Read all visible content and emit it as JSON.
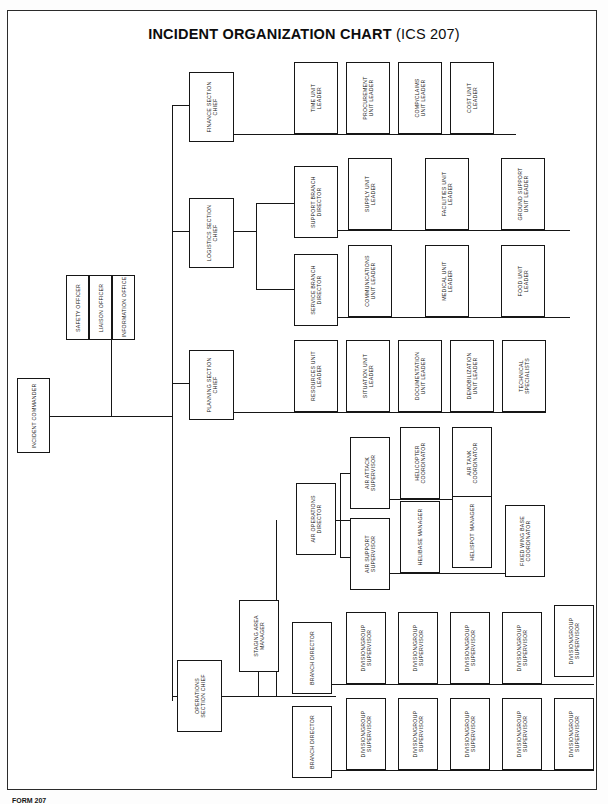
{
  "page": {
    "title_main": "INCIDENT ORGANIZATION CHART",
    "title_sub": "(ICS 207)",
    "footer": "FORM 207"
  },
  "chart_data": {
    "type": "diagram",
    "title": "INCIDENT ORGANIZATION CHART (ICS 207)",
    "orientation": "left-to-right hierarchy with rotated (vertical) box labels",
    "nodes": [
      {
        "id": "incident-commander",
        "label": "INCIDENT COMMANDER",
        "level": 0,
        "x": 17,
        "y": 378,
        "w": 33,
        "h": 75
      },
      {
        "id": "safety-officer",
        "label": "SAFETY OFFICER",
        "level": 1,
        "x": 66,
        "y": 275,
        "w": 23,
        "h": 65
      },
      {
        "id": "liaison-officer",
        "label": "LIAISON OFFICER",
        "level": 1,
        "x": 89,
        "y": 275,
        "w": 23,
        "h": 65
      },
      {
        "id": "information-officer",
        "label": "INFORMATION OFFICER",
        "level": 1,
        "x": 112,
        "y": 275,
        "w": 23,
        "h": 65
      },
      {
        "id": "finance-section-chief",
        "label": "FINANCE SECTION\nCHIEF",
        "level": 1,
        "x": 189,
        "y": 72,
        "w": 45,
        "h": 70
      },
      {
        "id": "time-unit-leader",
        "label": "TIME UNIT\nLEADER",
        "level": 2,
        "x": 294,
        "y": 62,
        "w": 44,
        "h": 72
      },
      {
        "id": "procurement-unit-leader",
        "label": "PROCUREMENT\nUNIT LEADER",
        "level": 2,
        "x": 346,
        "y": 62,
        "w": 44,
        "h": 72
      },
      {
        "id": "comp-claims-unit-leader",
        "label": "COMP/CLAIMS\nUNIT LEADER",
        "level": 2,
        "x": 398,
        "y": 62,
        "w": 44,
        "h": 72
      },
      {
        "id": "cost-unit-leader",
        "label": "COST UNIT\nLEADER",
        "level": 2,
        "x": 450,
        "y": 62,
        "w": 44,
        "h": 72
      },
      {
        "id": "logistics-section-chief",
        "label": "LOGISTICS SECTION\nCHIEF",
        "level": 1,
        "x": 189,
        "y": 198,
        "w": 45,
        "h": 70
      },
      {
        "id": "support-branch-director",
        "label": "SUPPORT BRANCH\nDIRECTOR",
        "level": 2,
        "x": 294,
        "y": 166,
        "w": 44,
        "h": 72
      },
      {
        "id": "supply-unit-leader",
        "label": "SUPPLY UNIT\nLEADER",
        "level": 3,
        "x": 348,
        "y": 158,
        "w": 44,
        "h": 72
      },
      {
        "id": "facilities-unit-leader",
        "label": "FACILITIES UNIT\nLEADER",
        "level": 3,
        "x": 425,
        "y": 158,
        "w": 44,
        "h": 72
      },
      {
        "id": "ground-support-unit-leader",
        "label": "GROUND SUPPORT\nUNIT LEADER",
        "level": 3,
        "x": 501,
        "y": 158,
        "w": 44,
        "h": 72
      },
      {
        "id": "service-branch-director",
        "label": "SERVICE BRANCH\nDIRECTOR",
        "level": 2,
        "x": 294,
        "y": 254,
        "w": 44,
        "h": 72
      },
      {
        "id": "communications-unit-leader",
        "label": "COMMUNICATIONS\nUNIT LEADER",
        "level": 3,
        "x": 348,
        "y": 245,
        "w": 44,
        "h": 72
      },
      {
        "id": "medical-unit-leader",
        "label": "MEDICAL UNIT\nLEADER",
        "level": 3,
        "x": 425,
        "y": 245,
        "w": 44,
        "h": 72
      },
      {
        "id": "food-unit-leader",
        "label": "FOOD UNIT\nLEADER",
        "level": 3,
        "x": 501,
        "y": 245,
        "w": 44,
        "h": 72
      },
      {
        "id": "planning-section-chief",
        "label": "PLANNING SECTION\nCHIEF",
        "level": 1,
        "x": 189,
        "y": 350,
        "w": 45,
        "h": 70
      },
      {
        "id": "resources-unit-leader",
        "label": "RESOURCES UNIT\nLEADER",
        "level": 2,
        "x": 294,
        "y": 340,
        "w": 44,
        "h": 72
      },
      {
        "id": "situation-unit-leader",
        "label": "SITUATION UNIT\nLEADER",
        "level": 2,
        "x": 346,
        "y": 340,
        "w": 44,
        "h": 72
      },
      {
        "id": "documentation-unit-leader",
        "label": "DOCUMENTATION\nUNIT LEADER",
        "level": 2,
        "x": 398,
        "y": 340,
        "w": 44,
        "h": 72
      },
      {
        "id": "demobilization-unit-leader",
        "label": "DEMOBILIZATION\nUNIT LEADER",
        "level": 2,
        "x": 450,
        "y": 340,
        "w": 44,
        "h": 72
      },
      {
        "id": "technical-specialists",
        "label": "TECHNICAL\nSPECIALISTS",
        "level": 2,
        "x": 502,
        "y": 340,
        "w": 44,
        "h": 72
      },
      {
        "id": "operations-section-chief",
        "label": "OPERATIONS\nSECTION CHIEF",
        "level": 1,
        "x": 177,
        "y": 660,
        "w": 45,
        "h": 72
      },
      {
        "id": "staging-area-manager",
        "label": "STAGING AREA\nMANAGER",
        "level": 2,
        "x": 239,
        "y": 600,
        "w": 40,
        "h": 72
      },
      {
        "id": "air-operations-director",
        "label": "AIR OPERATIONS\nDIRECTOR",
        "level": 2,
        "x": 296,
        "y": 483,
        "w": 40,
        "h": 72
      },
      {
        "id": "air-attack-supervisor",
        "label": "AIR ATTACK\nSUPERVISOR",
        "level": 3,
        "x": 350,
        "y": 437,
        "w": 40,
        "h": 72
      },
      {
        "id": "helicopter-coordinator",
        "label": "HELICOPTER\nCOORDINATOR",
        "level": 4,
        "x": 400,
        "y": 427,
        "w": 40,
        "h": 72
      },
      {
        "id": "air-tank-coordinator",
        "label": "AIR TANK\nCOORDINATOR",
        "level": 4,
        "x": 452,
        "y": 427,
        "w": 40,
        "h": 72
      },
      {
        "id": "air-support-supervisor",
        "label": "AIR SUPPORT\nSUPERVISOR",
        "level": 3,
        "x": 350,
        "y": 518,
        "w": 40,
        "h": 72
      },
      {
        "id": "helibase-manager",
        "label": "HELIBASE MANAGER",
        "level": 4,
        "x": 400,
        "y": 501,
        "w": 40,
        "h": 72
      },
      {
        "id": "helispot-manager",
        "label": "HELISPOT MANAGER",
        "level": 4,
        "x": 452,
        "y": 496,
        "w": 40,
        "h": 72
      },
      {
        "id": "fixed-wing-base-coordinator",
        "label": "FIXED WING BASE\nCOORDINATOR",
        "level": 4,
        "x": 505,
        "y": 505,
        "w": 40,
        "h": 72
      },
      {
        "id": "branch-director-1",
        "label": "BRANCH DIRECTOR",
        "level": 2,
        "x": 292,
        "y": 622,
        "w": 40,
        "h": 72
      },
      {
        "id": "division-group-supervisor-1-1",
        "label": "DIVISION/GROUP\nSUPERVISOR",
        "level": 3,
        "x": 346,
        "y": 612,
        "w": 40,
        "h": 72
      },
      {
        "id": "division-group-supervisor-1-2",
        "label": "DIVISION/GROUP\nSUPERVISOR",
        "level": 3,
        "x": 398,
        "y": 612,
        "w": 40,
        "h": 72
      },
      {
        "id": "division-group-supervisor-1-3",
        "label": "DIVISION/GROUP\nSUPERVISOR",
        "level": 3,
        "x": 450,
        "y": 612,
        "w": 40,
        "h": 72
      },
      {
        "id": "division-group-supervisor-1-4",
        "label": "DIVISION/GROUP\nSUPERVISOR",
        "level": 3,
        "x": 502,
        "y": 612,
        "w": 40,
        "h": 72
      },
      {
        "id": "division-group-supervisor-1-5",
        "label": "DIVISION/GROUP\nSUPERVISOR",
        "level": 3,
        "x": 554,
        "y": 605,
        "w": 40,
        "h": 72
      },
      {
        "id": "branch-director-2",
        "label": "BRANCH DIRECTOR",
        "level": 2,
        "x": 292,
        "y": 706,
        "w": 40,
        "h": 72
      },
      {
        "id": "division-group-supervisor-2-1",
        "label": "DIVISION/GROUP\nSUPERVISOR",
        "level": 3,
        "x": 346,
        "y": 698,
        "w": 40,
        "h": 72
      },
      {
        "id": "division-group-supervisor-2-2",
        "label": "DIVISION/GROUP\nSUPERVISOR",
        "level": 3,
        "x": 398,
        "y": 698,
        "w": 40,
        "h": 72
      },
      {
        "id": "division-group-supervisor-2-3",
        "label": "DIVISION/GROUP\nSUPERVISOR",
        "level": 3,
        "x": 450,
        "y": 698,
        "w": 40,
        "h": 72
      },
      {
        "id": "division-group-supervisor-2-4",
        "label": "DIVISION/GROUP\nSUPERVISOR",
        "level": 3,
        "x": 502,
        "y": 698,
        "w": 40,
        "h": 72
      },
      {
        "id": "division-group-supervisor-2-5",
        "label": "DIVISION/GROUP\nSUPERVISOR",
        "level": 3,
        "x": 554,
        "y": 698,
        "w": 40,
        "h": 72
      }
    ],
    "edges": [
      {
        "from": "incident-commander",
        "to": "command-staff"
      },
      {
        "from": "incident-commander",
        "to": "finance-section-chief"
      },
      {
        "from": "incident-commander",
        "to": "logistics-section-chief"
      },
      {
        "from": "incident-commander",
        "to": "planning-section-chief"
      },
      {
        "from": "incident-commander",
        "to": "operations-section-chief"
      },
      {
        "from": "finance-section-chief",
        "to": "time-unit-leader"
      },
      {
        "from": "finance-section-chief",
        "to": "procurement-unit-leader"
      },
      {
        "from": "finance-section-chief",
        "to": "comp-claims-unit-leader"
      },
      {
        "from": "finance-section-chief",
        "to": "cost-unit-leader"
      },
      {
        "from": "logistics-section-chief",
        "to": "support-branch-director"
      },
      {
        "from": "logistics-section-chief",
        "to": "service-branch-director"
      },
      {
        "from": "support-branch-director",
        "to": "supply-unit-leader"
      },
      {
        "from": "support-branch-director",
        "to": "facilities-unit-leader"
      },
      {
        "from": "support-branch-director",
        "to": "ground-support-unit-leader"
      },
      {
        "from": "service-branch-director",
        "to": "communications-unit-leader"
      },
      {
        "from": "service-branch-director",
        "to": "medical-unit-leader"
      },
      {
        "from": "service-branch-director",
        "to": "food-unit-leader"
      },
      {
        "from": "planning-section-chief",
        "to": "resources-unit-leader"
      },
      {
        "from": "planning-section-chief",
        "to": "situation-unit-leader"
      },
      {
        "from": "planning-section-chief",
        "to": "documentation-unit-leader"
      },
      {
        "from": "planning-section-chief",
        "to": "demobilization-unit-leader"
      },
      {
        "from": "planning-section-chief",
        "to": "technical-specialists"
      },
      {
        "from": "operations-section-chief",
        "to": "staging-area-manager"
      },
      {
        "from": "operations-section-chief",
        "to": "air-operations-director"
      },
      {
        "from": "operations-section-chief",
        "to": "branch-director-1"
      },
      {
        "from": "operations-section-chief",
        "to": "branch-director-2"
      },
      {
        "from": "air-operations-director",
        "to": "air-attack-supervisor"
      },
      {
        "from": "air-operations-director",
        "to": "air-support-supervisor"
      },
      {
        "from": "air-attack-supervisor",
        "to": "helicopter-coordinator"
      },
      {
        "from": "air-attack-supervisor",
        "to": "air-tank-coordinator"
      },
      {
        "from": "air-support-supervisor",
        "to": "helibase-manager"
      },
      {
        "from": "air-support-supervisor",
        "to": "helispot-manager"
      },
      {
        "from": "air-support-supervisor",
        "to": "fixed-wing-base-coordinator"
      },
      {
        "from": "branch-director-1",
        "to": "division-group-supervisor-1-1"
      },
      {
        "from": "branch-director-1",
        "to": "division-group-supervisor-1-2"
      },
      {
        "from": "branch-director-1",
        "to": "division-group-supervisor-1-3"
      },
      {
        "from": "branch-director-1",
        "to": "division-group-supervisor-1-4"
      },
      {
        "from": "branch-director-1",
        "to": "division-group-supervisor-1-5"
      },
      {
        "from": "branch-director-2",
        "to": "division-group-supervisor-2-1"
      },
      {
        "from": "branch-director-2",
        "to": "division-group-supervisor-2-2"
      },
      {
        "from": "branch-director-2",
        "to": "division-group-supervisor-2-3"
      },
      {
        "from": "branch-director-2",
        "to": "division-group-supervisor-2-4"
      },
      {
        "from": "branch-director-2",
        "to": "division-group-supervisor-2-5"
      }
    ],
    "connector_lines": [
      {
        "o": "v",
        "x": 172,
        "y": 105,
        "len": 596
      },
      {
        "o": "h",
        "x": 172,
        "y": 105,
        "len": 17
      },
      {
        "o": "h",
        "x": 172,
        "y": 231,
        "len": 17
      },
      {
        "o": "h",
        "x": 172,
        "y": 383,
        "len": 17
      },
      {
        "o": "h",
        "x": 172,
        "y": 696,
        "len": 6
      },
      {
        "o": "v",
        "x": 178,
        "y": 696,
        "len": 0
      },
      {
        "o": "h",
        "x": 50,
        "y": 416,
        "len": 122
      },
      {
        "o": "v",
        "x": 111,
        "y": 340,
        "len": 76
      },
      {
        "o": "h",
        "x": 234,
        "y": 134,
        "len": 282
      },
      {
        "o": "v",
        "x": 316,
        "y": 134,
        "len": 0
      },
      {
        "o": "v",
        "x": 368,
        "y": 134,
        "len": 0
      },
      {
        "o": "v",
        "x": 420,
        "y": 134,
        "len": 0
      },
      {
        "o": "v",
        "x": 472,
        "y": 134,
        "len": 0
      },
      {
        "o": "h",
        "x": 234,
        "y": 231,
        "len": 22
      },
      {
        "o": "v",
        "x": 256,
        "y": 203,
        "len": 86
      },
      {
        "o": "h",
        "x": 256,
        "y": 203,
        "len": 38
      },
      {
        "o": "h",
        "x": 256,
        "y": 289,
        "len": 38
      },
      {
        "o": "h",
        "x": 338,
        "y": 230,
        "len": 232
      },
      {
        "o": "h",
        "x": 338,
        "y": 317,
        "len": 232
      },
      {
        "o": "h",
        "x": 234,
        "y": 412,
        "len": 312
      },
      {
        "o": "h",
        "x": 222,
        "y": 696,
        "len": 36
      },
      {
        "o": "v",
        "x": 258,
        "y": 672,
        "len": 24
      },
      {
        "o": "v",
        "x": 276,
        "y": 520,
        "len": 176
      },
      {
        "o": "h",
        "x": 258,
        "y": 696,
        "len": 78
      },
      {
        "o": "h",
        "x": 336,
        "y": 520,
        "len": 14
      },
      {
        "o": "v",
        "x": 340,
        "y": 473,
        "len": 84
      },
      {
        "o": "h",
        "x": 340,
        "y": 473,
        "len": 10
      },
      {
        "o": "h",
        "x": 340,
        "y": 557,
        "len": 10
      },
      {
        "o": "h",
        "x": 390,
        "y": 499,
        "len": 102
      },
      {
        "o": "h",
        "x": 390,
        "y": 573,
        "len": 155
      },
      {
        "o": "h",
        "x": 332,
        "y": 684,
        "len": 262
      },
      {
        "o": "h",
        "x": 332,
        "y": 770,
        "len": 262
      }
    ]
  }
}
